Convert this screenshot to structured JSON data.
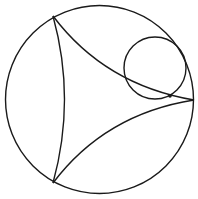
{
  "diagram": {
    "type": "poincare-disk-ideal-triangle-with-horocycle",
    "colors": {
      "stroke": "#1a1a1a",
      "background": "#ffffff",
      "point": "#1a1a1a"
    },
    "boundary_circle": {
      "cx": 99.5,
      "cy": 99.5,
      "r": 94
    },
    "ideal_vertices": [
      {
        "id": "A",
        "x": 53,
        "y": 16
      },
      {
        "id": "B",
        "x": 53,
        "y": 183
      },
      {
        "id": "C",
        "x": 194,
        "y": 100
      }
    ],
    "geodesics": [
      {
        "from": "A",
        "to": "B",
        "d": "M53,16 Q76,99.5 53,183"
      },
      {
        "from": "A",
        "to": "C",
        "d": "M53,16 Q105,85 194,100"
      },
      {
        "from": "B",
        "to": "C",
        "d": "M53,183 Q105,114 194,100"
      }
    ],
    "horocycle": {
      "cx": 155,
      "cy": 68,
      "r": 31
    },
    "point": {
      "x": 170,
      "y": 96,
      "r": 1.8
    }
  }
}
